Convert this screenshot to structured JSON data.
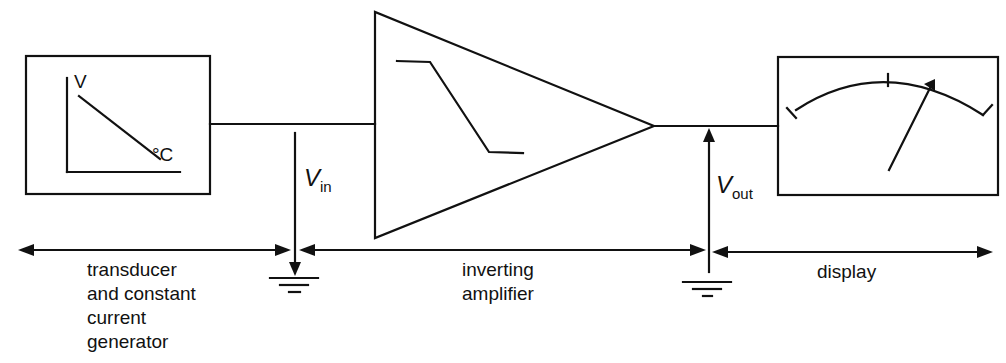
{
  "diagram": {
    "type": "block-diagram",
    "transducer": {
      "graph_y_label": "V",
      "graph_x_label": "°C",
      "section_label_lines": [
        "transducer",
        "and constant",
        "current",
        "generator"
      ]
    },
    "input_voltage": {
      "symbol": "V",
      "subscript": "in"
    },
    "amplifier": {
      "section_label_lines": [
        "inverting",
        "amplifier"
      ]
    },
    "output_voltage": {
      "symbol": "V",
      "subscript": "out"
    },
    "display": {
      "section_label": "display"
    },
    "colors": {
      "line": "#111111",
      "background": "#ffffff"
    }
  }
}
